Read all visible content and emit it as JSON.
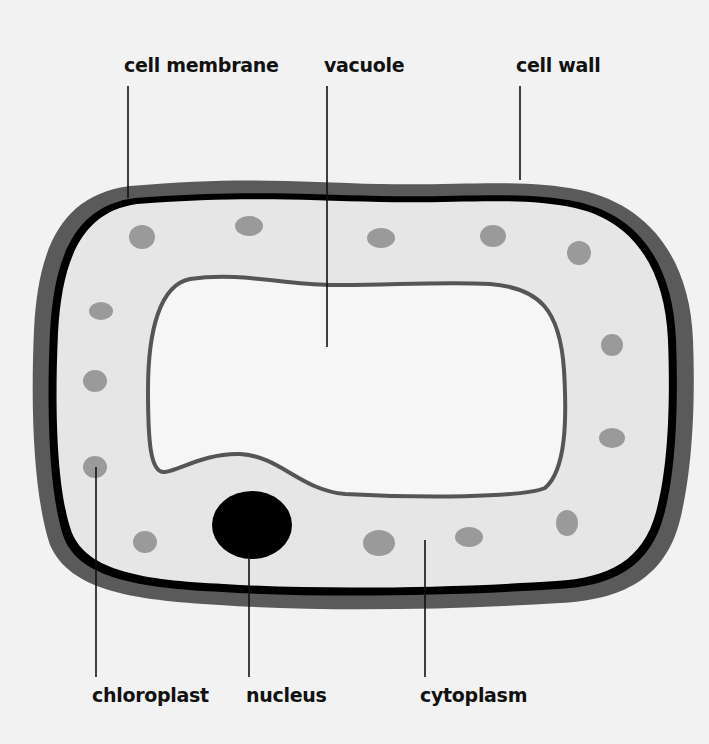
{
  "diagram": {
    "colors": {
      "background": "#f2f2f2",
      "cell_wall": "#5a5a5a",
      "cell_membrane": "#000000",
      "cytoplasm": "#e6e6e6",
      "vacuole_fill": "#f6f6f6",
      "vacuole_outline": "#555555",
      "chloroplast": "#9a9a9a",
      "nucleus": "#000000",
      "leader_line": "#111111"
    },
    "labels": {
      "top": [
        {
          "id": "cell-membrane",
          "text": "cell membrane"
        },
        {
          "id": "vacuole",
          "text": "vacuole"
        },
        {
          "id": "cell-wall",
          "text": "cell wall"
        }
      ],
      "bottom": [
        {
          "id": "chloroplast",
          "text": "chloroplast"
        },
        {
          "id": "nucleus",
          "text": "nucleus"
        },
        {
          "id": "cytoplasm",
          "text": "cytoplasm"
        }
      ]
    },
    "chloroplast_count": 15,
    "nucleus_count": 1
  }
}
